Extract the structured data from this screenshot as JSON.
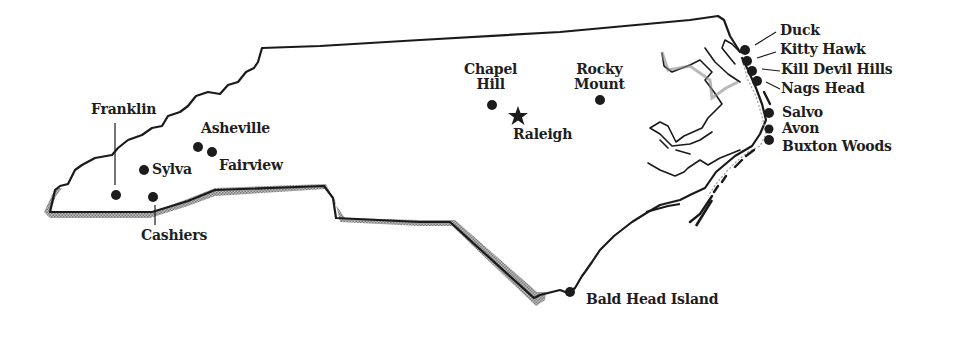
{
  "map": {
    "region": "North Carolina",
    "colors": {
      "outline": "#1a1a1a",
      "shadow": "#9a9a9a",
      "marker": "#1c1c1c",
      "label": "#1e1e1e",
      "background": "#ffffff"
    },
    "capital": {
      "name": "Raleigh",
      "icon": "star-icon"
    },
    "places": [
      {
        "id": "franklin",
        "name": "Franklin",
        "icon": "dot-marker-icon"
      },
      {
        "id": "asheville",
        "name": "Asheville",
        "icon": "dot-marker-icon"
      },
      {
        "id": "sylva",
        "name": "Sylva",
        "icon": "dot-marker-icon"
      },
      {
        "id": "fairview",
        "name": "Fairview",
        "icon": "dot-marker-icon"
      },
      {
        "id": "cashiers",
        "name": "Cashiers",
        "icon": "dot-marker-icon"
      },
      {
        "id": "chapel-hill",
        "name_line1": "Chapel",
        "name_line2": "Hill",
        "icon": "dot-marker-icon"
      },
      {
        "id": "rocky-mount",
        "name_line1": "Rocky",
        "name_line2": "Mount",
        "icon": "dot-marker-icon"
      },
      {
        "id": "duck",
        "name": "Duck",
        "icon": "dot-marker-icon"
      },
      {
        "id": "kitty-hawk",
        "name": "Kitty Hawk",
        "icon": "dot-marker-icon"
      },
      {
        "id": "kill-devil-hills",
        "name": "Kill Devil Hills",
        "icon": "dot-marker-icon"
      },
      {
        "id": "nags-head",
        "name": "Nags Head",
        "icon": "dot-marker-icon"
      },
      {
        "id": "salvo",
        "name": "Salvo",
        "icon": "dot-marker-icon"
      },
      {
        "id": "avon",
        "name": "Avon",
        "icon": "dot-marker-icon"
      },
      {
        "id": "buxton-woods",
        "name": "Buxton Woods",
        "icon": "dot-marker-icon"
      },
      {
        "id": "bald-head-island",
        "name": "Bald Head Island",
        "icon": "dot-marker-icon"
      }
    ]
  }
}
